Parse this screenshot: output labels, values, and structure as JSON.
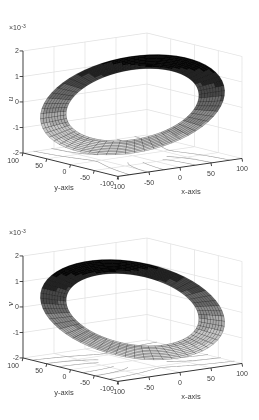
{
  "figure": {
    "kind": "matlab-3d-surface-pair",
    "background": "#ffffff"
  },
  "styles": {
    "grid_color": "#e1e1e1",
    "axis_color": "#2f2f2f",
    "contour_color": "#949494",
    "mesh_edge": "rgba(0,0,0,0.55)",
    "tick_text": "#3d3d3d",
    "surface_grays": [
      6,
      34,
      70,
      104,
      138,
      170,
      197,
      219
    ]
  },
  "chart_data": [
    {
      "type": "surface",
      "id": "u",
      "zlabel": "u",
      "exponent": {
        "base": "×10",
        "power": "-3"
      },
      "zticks": [
        2,
        1,
        0,
        -1,
        -2
      ],
      "ztick_labels": [
        "2",
        "1",
        "0",
        "-1",
        "-2"
      ],
      "zlim_e3": [
        -2,
        2
      ],
      "xlabel": "x-axis",
      "xticks": [
        -100,
        -50,
        0,
        50,
        100
      ],
      "xtick_labels": [
        "-100",
        "-50",
        "0",
        "50",
        "100"
      ],
      "xlim": [
        -100,
        100
      ],
      "ylabel": "y-axis",
      "yticks": [
        100,
        50,
        0,
        -50,
        -100
      ],
      "ytick_labels": [
        "100",
        "50",
        "0",
        "-50",
        "-100"
      ],
      "ylim": [
        -100,
        100
      ],
      "view": {
        "azimuth_deg": -37.5,
        "elevation_deg": 30
      },
      "surface": {
        "shape": "tilted annulus band (displacement u over ring mesh)",
        "r_inner": 85,
        "r_outer": 118,
        "n_theta": 60,
        "n_radial": 9,
        "tilt_azimuth_deg": 30,
        "z_amplitude_e3": 1.32,
        "formula": "u(r,th) ~ 1.12e-3*(r/100)*cos(th-30deg)"
      },
      "floor_contours": {
        "component": "x",
        "strength": 0.18,
        "hole_radius": 44,
        "levels": [
          -1.2,
          -0.9,
          -0.6,
          -0.3,
          0.3,
          0.6,
          0.9,
          1.2
        ],
        "field": "x*(1+0.18*(100/r)^2) level curves on z=-2e-3 plane"
      },
      "colormap": "gray, reversed, 8 discrete levels (high value = black)"
    },
    {
      "type": "surface",
      "id": "v",
      "zlabel": "v",
      "exponent": {
        "base": "×10",
        "power": "-3"
      },
      "zticks": [
        2,
        1,
        0,
        -1,
        -2
      ],
      "ztick_labels": [
        "2",
        "1",
        "0",
        "-1",
        "-2"
      ],
      "zlim_e3": [
        -2,
        2
      ],
      "xlabel": "x-axis",
      "xticks": [
        -100,
        -50,
        0,
        50,
        100
      ],
      "xtick_labels": [
        "-100",
        "-50",
        "0",
        "50",
        "100"
      ],
      "xlim": [
        -100,
        100
      ],
      "ylabel": "y-axis",
      "yticks": [
        100,
        50,
        0,
        -50,
        -100
      ],
      "ytick_labels": [
        "100",
        "50",
        "0",
        "-50",
        "-100"
      ],
      "ylim": [
        -100,
        100
      ],
      "view": {
        "azimuth_deg": -37.5,
        "elevation_deg": 30
      },
      "surface": {
        "shape": "tilted annulus band (displacement v over ring mesh)",
        "r_inner": 85,
        "r_outer": 118,
        "n_theta": 60,
        "n_radial": 9,
        "tilt_azimuth_deg": 75,
        "z_amplitude_e3": 1.32,
        "formula": "v(r,th) ~ 1.12e-3*(r/100)*cos(th-75deg)"
      },
      "floor_contours": {
        "component": "y",
        "strength": 0.18,
        "hole_radius": 44,
        "levels": [
          -1.2,
          -0.9,
          -0.6,
          -0.3,
          0.3,
          0.6,
          0.9,
          1.2
        ],
        "field": "y*(1+0.18*(100/r)^2) level curves on z=-2e-3 plane"
      },
      "colormap": "gray, reversed, 8 discrete levels (high value = black)"
    }
  ]
}
